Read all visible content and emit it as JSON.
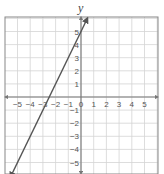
{
  "chart_data": {
    "type": "line",
    "title": "",
    "xlabel": "",
    "ylabel": "y",
    "xlim": [
      -6,
      6
    ],
    "ylim": [
      -6,
      6
    ],
    "grid": true,
    "x_ticks": [
      -5,
      -4,
      -3,
      -2,
      -1,
      0,
      1,
      2,
      3,
      4,
      5
    ],
    "y_ticks": [
      5,
      4,
      3,
      2,
      1,
      -1,
      -2,
      -3,
      -4,
      -5
    ],
    "series": [
      {
        "name": "line",
        "equation": "y = 2x + 5",
        "x": [
          -5.5,
          0.45
        ],
        "y": [
          -6,
          5.9
        ],
        "arrows": "both"
      }
    ]
  },
  "colors": {
    "line": "#555555",
    "axis": "#777777",
    "grid": "#d4d4d4",
    "border": "#888888"
  }
}
